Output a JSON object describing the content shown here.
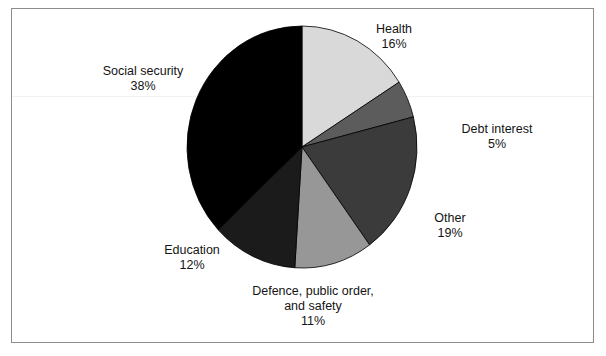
{
  "chart_data": {
    "type": "pie",
    "title": "",
    "subtitle": "",
    "xlabel": "",
    "ylabel": "",
    "legend_position": "none",
    "grid": false,
    "start_angle_deg": 0,
    "direction": "clockwise",
    "categories": [
      "Health",
      "Debt interest",
      "Other",
      "Defence, public order, and safety",
      "Education",
      "Social security"
    ],
    "values": [
      16,
      5,
      19,
      11,
      12,
      38
    ],
    "value_unit": "%",
    "slices": [
      {
        "label": "Health",
        "label_line1": "Health",
        "value": 16,
        "value_text": "16%",
        "color": "#d9d9d9",
        "start_deg": 0,
        "end_deg": 57.6
      },
      {
        "label": "Debt interest",
        "label_line1": "Debt interest",
        "value": 5,
        "value_text": "5%",
        "color": "#5c5c5c",
        "start_deg": 57.6,
        "end_deg": 75.6
      },
      {
        "label": "Other",
        "label_line1": "Other",
        "value": 19,
        "value_text": "19%",
        "color": "#3b3b3b",
        "start_deg": 75.6,
        "end_deg": 144.0
      },
      {
        "label": "Defence, public order, and safety",
        "label_line1": "Defence, public order,",
        "label_line2": "and safety",
        "value": 11,
        "value_text": "11%",
        "color": "#979797",
        "start_deg": 144.0,
        "end_deg": 183.6
      },
      {
        "label": "Education",
        "label_line1": "Education",
        "value": 12,
        "value_text": "12%",
        "color": "#1b1b1b",
        "start_deg": 183.6,
        "end_deg": 226.8
      },
      {
        "label": "Social security",
        "label_line1": "Social security",
        "value": 38,
        "value_text": "38%",
        "color": "#000000",
        "start_deg": 226.8,
        "end_deg": 360.0
      }
    ],
    "geometry": {
      "center_x": 302,
      "center_y": 147,
      "radius_x": 115,
      "radius_y": 121
    }
  },
  "colors": {
    "frame_border": "#8c8c8c",
    "background": "#ffffff",
    "text": "#141414"
  }
}
